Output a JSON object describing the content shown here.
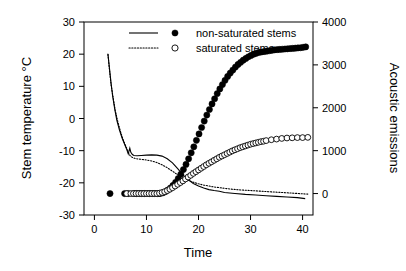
{
  "chart_data": {
    "type": "line",
    "title": "",
    "xlabel": "Time",
    "ylabel": "Stem temperature °C",
    "y2label": "Acoustic emissions",
    "xlim": [
      -2,
      42
    ],
    "ylim": [
      -30,
      30
    ],
    "y2lim": [
      -500,
      4000
    ],
    "grid": false,
    "legend_position": "top-center",
    "xticks": [
      0,
      10,
      20,
      30,
      40
    ],
    "xtick_labels": [
      "0",
      "10",
      "20",
      "30",
      "40"
    ],
    "yticks": [
      -30,
      -20,
      -10,
      0,
      10,
      20,
      30
    ],
    "ytick_labels": [
      "-30",
      "-20",
      "-10",
      "0",
      "10",
      "20",
      "30"
    ],
    "y2ticks": [
      0,
      1000,
      2000,
      3000,
      4000
    ],
    "y2tick_labels": [
      "0",
      "1000",
      "2000",
      "3000",
      "4000"
    ],
    "legend": [
      {
        "label": "non-saturated stems",
        "line_style": "solid",
        "marker": "filled-circle"
      },
      {
        "label": "saturated stems",
        "line_style": "dotted",
        "marker": "open-circle"
      }
    ],
    "series": [
      {
        "name": "non-saturated stems temperature",
        "axis": "left",
        "style": "solid",
        "marker": "none",
        "x": [
          2.6,
          2.9,
          3.2,
          3.5,
          3.9,
          4.3,
          4.8,
          5.3,
          5.8,
          6.2,
          6.5,
          6.8,
          7.0,
          7.3,
          7.6,
          8.2,
          9.0,
          10.0,
          11.0,
          12.0,
          13.0,
          14.0,
          15.0,
          16.0,
          17.0,
          18.0,
          19.0,
          20.0,
          21.0,
          22.0,
          23.0,
          24.0,
          25.0,
          27.0,
          29.0,
          31.0,
          33.0,
          35.0,
          37.0,
          39.0,
          40.5
        ],
        "y": [
          20.0,
          15.5,
          11.0,
          7.0,
          3.0,
          -0.5,
          -3.5,
          -6.0,
          -8.0,
          -9.6,
          -11.0,
          -9.2,
          -10.5,
          -11.2,
          -11.5,
          -11.6,
          -11.5,
          -11.4,
          -11.3,
          -11.4,
          -11.7,
          -12.5,
          -13.8,
          -15.6,
          -17.5,
          -19.0,
          -20.2,
          -21.0,
          -21.6,
          -22.1,
          -22.4,
          -22.6,
          -23.0,
          -23.3,
          -23.6,
          -23.8,
          -24.0,
          -24.2,
          -24.4,
          -24.6,
          -24.9
        ]
      },
      {
        "name": "saturated stems temperature",
        "axis": "left",
        "style": "dotted",
        "marker": "none",
        "x": [
          2.6,
          2.9,
          3.2,
          3.6,
          4.0,
          4.5,
          5.0,
          5.5,
          6.0,
          6.4,
          6.7,
          7.0,
          7.4,
          8.0,
          9.0,
          10.0,
          11.0,
          12.0,
          13.0,
          14.0,
          15.0,
          16.0,
          17.0,
          18.0,
          19.0,
          20.0,
          21.0,
          22.0,
          23.0,
          24.0,
          26.0,
          28.0,
          30.0,
          32.0,
          34.0,
          36.0,
          38.0,
          40.0,
          41.0
        ],
        "y": [
          20.0,
          15.0,
          10.5,
          6.5,
          2.5,
          -1.0,
          -4.0,
          -6.5,
          -8.5,
          -10.0,
          -11.2,
          -11.8,
          -12.2,
          -12.5,
          -12.7,
          -12.9,
          -13.2,
          -13.7,
          -14.4,
          -15.3,
          -16.4,
          -17.5,
          -18.5,
          -19.2,
          -19.8,
          -20.3,
          -20.7,
          -21.0,
          -21.3,
          -21.5,
          -21.9,
          -22.2,
          -22.4,
          -22.6,
          -22.8,
          -23.0,
          -23.2,
          -23.4,
          -23.5
        ]
      },
      {
        "name": "non-saturated stems acoustic emissions",
        "axis": "right",
        "style": "markers",
        "marker": "filled-circle",
        "x": [
          3.0,
          5.8,
          6.5,
          7.6,
          8.1,
          8.6,
          9.1,
          9.6,
          10.1,
          10.6,
          11.1,
          11.6,
          12.1,
          12.6,
          13.1,
          13.6,
          14.1,
          14.6,
          15.1,
          15.6,
          16.1,
          16.6,
          17.1,
          17.6,
          18.1,
          18.6,
          19.1,
          19.6,
          20.1,
          20.6,
          21.1,
          21.6,
          22.1,
          22.6,
          23.1,
          23.6,
          24.1,
          24.6,
          25.1,
          25.6,
          26.1,
          26.6,
          27.1,
          27.6,
          28.1,
          28.6,
          29.1,
          29.6,
          30.1,
          30.6,
          31.1,
          31.6,
          32.1,
          32.6,
          33.1,
          33.6,
          34.1,
          34.6,
          35.1,
          35.6,
          36.1,
          36.6,
          37.1,
          37.6,
          38.1,
          38.6,
          39.1,
          39.6,
          40.1,
          40.6
        ],
        "y": [
          0,
          0,
          0,
          0,
          0,
          0,
          0,
          0,
          0,
          0,
          0,
          0,
          0,
          0,
          15,
          40,
          80,
          130,
          190,
          260,
          350,
          450,
          560,
          680,
          810,
          950,
          1090,
          1240,
          1390,
          1540,
          1690,
          1830,
          1960,
          2090,
          2210,
          2330,
          2440,
          2540,
          2640,
          2730,
          2810,
          2880,
          2950,
          3010,
          3060,
          3110,
          3150,
          3190,
          3220,
          3250,
          3270,
          3290,
          3300,
          3310,
          3320,
          3330,
          3340,
          3350,
          3355,
          3360,
          3365,
          3370,
          3375,
          3380,
          3385,
          3390,
          3395,
          3400,
          3410,
          3420
        ]
      },
      {
        "name": "saturated stems acoustic emissions",
        "axis": "right",
        "style": "markers",
        "marker": "open-circle",
        "x": [
          6.2,
          7.0,
          7.5,
          8.0,
          8.5,
          9.0,
          9.5,
          10.0,
          10.5,
          11.0,
          11.5,
          12.0,
          12.5,
          13.0,
          13.5,
          14.0,
          14.5,
          15.0,
          15.5,
          16.0,
          16.5,
          17.0,
          17.5,
          18.0,
          18.5,
          19.0,
          19.5,
          20.0,
          20.5,
          21.0,
          21.5,
          22.0,
          22.5,
          23.0,
          23.5,
          24.0,
          24.5,
          25.0,
          25.5,
          26.0,
          26.5,
          27.0,
          27.5,
          28.0,
          28.5,
          29.0,
          29.5,
          30.0,
          30.5,
          31.0,
          31.5,
          32.0,
          32.5,
          33.0,
          34.0,
          35.0,
          36.0,
          37.0,
          38.0,
          39.0,
          40.0,
          41.0
        ],
        "y": [
          0,
          0,
          0,
          0,
          0,
          0,
          0,
          0,
          0,
          0,
          0,
          0,
          10,
          25,
          45,
          70,
          100,
          135,
          175,
          215,
          255,
          295,
          340,
          385,
          425,
          470,
          510,
          550,
          590,
          630,
          670,
          705,
          740,
          775,
          810,
          845,
          875,
          905,
          935,
          965,
          995,
          1020,
          1045,
          1070,
          1090,
          1110,
          1130,
          1150,
          1165,
          1180,
          1195,
          1210,
          1220,
          1235,
          1255,
          1270,
          1285,
          1295,
          1300,
          1305,
          1305,
          1310
        ]
      }
    ]
  }
}
